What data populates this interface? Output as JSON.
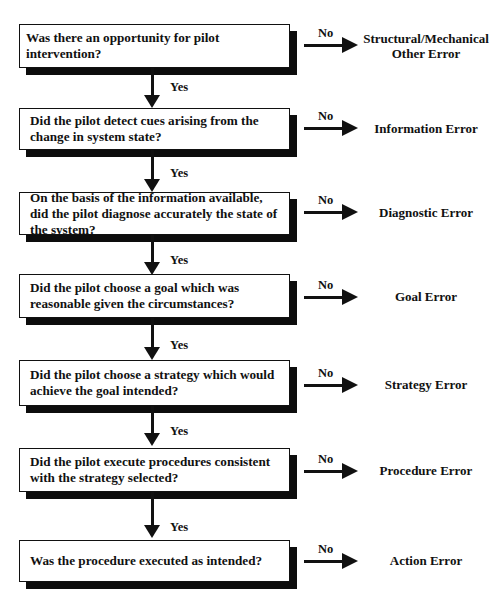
{
  "diagram": {
    "type": "flowchart",
    "title_fragment": "",
    "questions": [
      {
        "text": "Was there an opportunity for pilot intervention?",
        "no_label": "No",
        "outcome": "Structural/Mechanical",
        "outcome_line2": "Other Error",
        "yes_label": "Yes"
      },
      {
        "text": "Did the pilot detect cues arising from the change in system state?",
        "no_label": "No",
        "outcome": "Information Error",
        "outcome_line2": "",
        "yes_label": "Yes"
      },
      {
        "text": "On the basis of the information available, did the pilot diagnose accurately the state of the system?",
        "no_label": "No",
        "outcome": "Diagnostic Error",
        "outcome_line2": "",
        "yes_label": "Yes"
      },
      {
        "text": "Did the pilot choose a goal which was reasonable given the circumstances?",
        "no_label": "No",
        "outcome": "Goal Error",
        "outcome_line2": "",
        "yes_label": "Yes"
      },
      {
        "text": "Did the pilot choose a strategy which would achieve the goal intended?",
        "no_label": "No",
        "outcome": "Strategy Error",
        "outcome_line2": "",
        "yes_label": "Yes"
      },
      {
        "text": "Did the pilot execute procedures consistent with the strategy selected?",
        "no_label": "No",
        "outcome": "Procedure Error",
        "outcome_line2": "",
        "yes_label": "Yes"
      },
      {
        "text": "Was the procedure executed as intended?",
        "no_label": "No",
        "outcome": "Action Error",
        "outcome_line2": ""
      }
    ],
    "colors": {
      "box_fill": "#ffffff",
      "box_border": "#111111",
      "shadow": "#0d0d0d",
      "text": "#111111"
    }
  }
}
